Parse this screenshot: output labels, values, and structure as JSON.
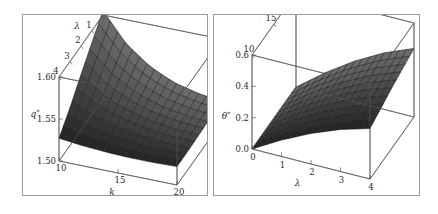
{
  "figure": {
    "background": "#ffffff",
    "frame_color": "#9a9a9a",
    "panel_count": 2
  },
  "chart_data": [
    {
      "type": "surface3d",
      "panel": "left",
      "title": "",
      "xlabel": "k",
      "ylabel": "λ",
      "zlabel": "q*",
      "zlabel_base": "q",
      "zlabel_sup": "*",
      "xlim": [
        10,
        20
      ],
      "ylim": [
        0,
        4
      ],
      "zlim": [
        1.5,
        1.6
      ],
      "xticks": [
        10,
        15,
        20
      ],
      "xticklabels": [
        "10",
        "15",
        "20"
      ],
      "yticks": [
        4,
        3,
        2,
        1,
        0
      ],
      "yticklabels": [
        "4",
        "3",
        "2",
        "1",
        "0"
      ],
      "zticks": [
        1.5,
        1.55,
        1.6
      ],
      "zticklabels": [
        "1.50",
        "1.55",
        "1.60"
      ],
      "grid": false,
      "legend": "none",
      "surface_color": "#111111",
      "mesh_color": "#3a3a3a",
      "description": "Dark mesh surface q*(k,λ) descending steeply from a peak near 1.605 at k=10, λ=4 and flattening to a plateau near 1.53 for large k.",
      "x": [
        10,
        12,
        14,
        16,
        18,
        20
      ],
      "y": [
        0,
        1,
        2,
        3,
        4
      ],
      "z": [
        [
          1.527,
          1.524,
          1.522,
          1.521,
          1.521,
          1.522
        ],
        [
          1.545,
          1.534,
          1.528,
          1.524,
          1.522,
          1.522
        ],
        [
          1.566,
          1.546,
          1.535,
          1.528,
          1.524,
          1.523
        ],
        [
          1.586,
          1.559,
          1.542,
          1.532,
          1.527,
          1.524
        ],
        [
          1.605,
          1.571,
          1.55,
          1.537,
          1.53,
          1.526
        ]
      ]
    },
    {
      "type": "surface3d",
      "panel": "right",
      "title": "",
      "xlabel": "λ",
      "ylabel": "k",
      "zlabel": "θ*",
      "zlabel_base": "θ",
      "zlabel_sup": "*",
      "xlim": [
        0,
        4
      ],
      "ylim": [
        10,
        20
      ],
      "zlim": [
        0.0,
        0.6
      ],
      "xticks": [
        0,
        1,
        2,
        3,
        4
      ],
      "xticklabels": [
        "0",
        "1",
        "2",
        "3",
        "4"
      ],
      "yticks": [
        10,
        15,
        20
      ],
      "yticklabels": [
        "10",
        "15",
        "20"
      ],
      "zticks": [
        0.0,
        0.2,
        0.4,
        0.6
      ],
      "zticklabels": [
        "0.0",
        "0.2",
        "0.4",
        "0.6"
      ],
      "grid": false,
      "legend": "none",
      "surface_color": "#111111",
      "mesh_color": "#3a3a3a",
      "description": "Dark mesh surface θ*(λ,k) rising from 0 at λ=0 and fanning out to roughly 0.30-0.45 at λ=4, higher for larger k.",
      "x": [
        0,
        1,
        2,
        3,
        4
      ],
      "y": [
        10,
        15,
        20
      ],
      "z": [
        [
          0.0,
          0.105,
          0.195,
          0.268,
          0.322
        ],
        [
          0.0,
          0.125,
          0.232,
          0.32,
          0.386
        ],
        [
          0.0,
          0.14,
          0.262,
          0.362,
          0.438
        ]
      ]
    }
  ]
}
